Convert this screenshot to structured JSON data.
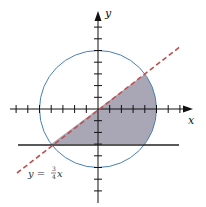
{
  "figure": {
    "x_axis_label": "x",
    "y_axis_label": "y",
    "line_label_prefix": "y =",
    "line_label_num": "3",
    "line_label_den": "4",
    "line_label_var": "x",
    "circle": {
      "center": [
        0,
        0
      ],
      "radius": 5,
      "color": "#4a7fb5"
    },
    "dashed_line": {
      "equation": "y = 3/4 x",
      "color": "#c0504d"
    },
    "horizontal_line": {
      "equation": "y = -3",
      "color": "#222222"
    },
    "shaded_region": {
      "color": "#9a97a8",
      "bounds": "below y=3/4x, above y=-3, inside circle"
    },
    "x_ticks": [
      -7,
      -6,
      -5,
      -4,
      -3,
      -2,
      -1,
      1,
      2,
      3,
      4,
      5,
      6,
      7
    ],
    "y_ticks": [
      -7,
      -6,
      -5,
      -4,
      -3,
      -2,
      -1,
      1,
      2,
      3,
      4,
      5,
      6,
      7
    ]
  }
}
